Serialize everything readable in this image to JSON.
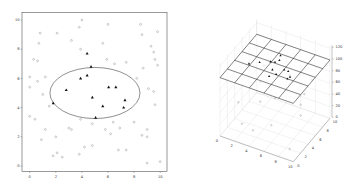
{
  "chart_data": [
    {
      "type": "scatter",
      "title": "",
      "xlabel": "",
      "ylabel": "",
      "xlim": [
        -0.5,
        10.5
      ],
      "ylim": [
        -0.4,
        10.4
      ],
      "grid": false,
      "x_ticks": [
        "0",
        "2",
        "4",
        "6",
        "8",
        "10"
      ],
      "y_ticks": [
        "0",
        "2",
        "4",
        "6",
        "8",
        "10"
      ],
      "series": [
        {
          "name": "background points",
          "marker": "circle",
          "color": "#9a9a9a",
          "points": [
            [
              4.0,
              10.0
            ],
            [
              3.8,
              9.5
            ],
            [
              6.0,
              9.7
            ],
            [
              8.5,
              9.7
            ],
            [
              0.8,
              9.1
            ],
            [
              2.1,
              9.1
            ],
            [
              9.8,
              9.2
            ],
            [
              0.7,
              8.4
            ],
            [
              3.2,
              8.6
            ],
            [
              5.6,
              8.4
            ],
            [
              8.6,
              9.0
            ],
            [
              9.3,
              8.2
            ],
            [
              3.9,
              8.0
            ],
            [
              9.5,
              7.8
            ],
            [
              0.3,
              7.3
            ],
            [
              0.6,
              7.2
            ],
            [
              5.9,
              7.3
            ],
            [
              7.4,
              7.1
            ],
            [
              6.5,
              7.0
            ],
            [
              9.6,
              7.3
            ],
            [
              9.8,
              6.9
            ],
            [
              8.7,
              6.7
            ],
            [
              0.0,
              6.1
            ],
            [
              1.2,
              6.1
            ],
            [
              8.2,
              6.0
            ],
            [
              0.6,
              5.8
            ],
            [
              0.0,
              5.4
            ],
            [
              9.1,
              5.3
            ],
            [
              1.0,
              4.9
            ],
            [
              9.5,
              5.1
            ],
            [
              1.5,
              4.1
            ],
            [
              9.6,
              4.2
            ],
            [
              3.9,
              3.2
            ],
            [
              4.8,
              2.9
            ],
            [
              6.4,
              3.0
            ],
            [
              6.9,
              2.6
            ],
            [
              0.0,
              3.4
            ],
            [
              0.4,
              3.2
            ],
            [
              5.8,
              2.5
            ],
            [
              8.0,
              3.0
            ],
            [
              3.0,
              2.6
            ],
            [
              3.2,
              2.5
            ],
            [
              1.2,
              2.5
            ],
            [
              9.0,
              2.5
            ],
            [
              8.6,
              2.1
            ],
            [
              9.0,
              2.0
            ],
            [
              2.0,
              2.0
            ],
            [
              6.2,
              2.2
            ],
            [
              0.9,
              1.8
            ],
            [
              4.2,
              1.3
            ],
            [
              4.8,
              1.4
            ],
            [
              6.8,
              1.1
            ],
            [
              7.4,
              1.1
            ],
            [
              2.1,
              0.9
            ],
            [
              1.8,
              0.7
            ],
            [
              3.8,
              0.8
            ],
            [
              2.5,
              0.6
            ],
            [
              9.0,
              0.2
            ],
            [
              10.0,
              0.3
            ]
          ]
        },
        {
          "name": "points inside ellipse",
          "marker": "triangle",
          "color": "#111111",
          "points": [
            [
              4.4,
              7.7
            ],
            [
              4.7,
              6.8
            ],
            [
              3.9,
              6.0
            ],
            [
              4.4,
              6.2
            ],
            [
              2.8,
              5.2
            ],
            [
              6.05,
              5.4
            ],
            [
              6.6,
              5.4
            ],
            [
              4.8,
              4.7
            ],
            [
              1.8,
              4.3
            ],
            [
              5.6,
              4.1
            ],
            [
              7.3,
              4.5
            ],
            [
              7.2,
              4.0
            ],
            [
              5.05,
              3.3
            ]
          ]
        }
      ],
      "annotations": [
        {
          "type": "ellipse",
          "center": [
            5.0,
            5.0
          ],
          "rx": 3.45,
          "ry": 1.75,
          "color": "#444444"
        }
      ]
    },
    {
      "type": "scatter3d",
      "title": "",
      "xlabel": "",
      "ylabel": "",
      "zlabel": "",
      "xlim": [
        0,
        10
      ],
      "ylim": [
        0,
        10
      ],
      "zlim": [
        0,
        120
      ],
      "x_ticks": [
        "0",
        "2",
        "4",
        "6",
        "8",
        "10"
      ],
      "y_ticks": [
        "0",
        "2",
        "4",
        "6",
        "8",
        "10"
      ],
      "z_ticks": [
        "0",
        "20",
        "40",
        "60",
        "80",
        "100",
        "120"
      ],
      "grid": true,
      "surface": {
        "type": "plane",
        "z": 100,
        "grid_cells": [
          5,
          5
        ],
        "color": "#333333"
      },
      "series": [
        {
          "name": "points on plane",
          "marker": "triangle",
          "color": "#111111",
          "points": [
            [
              4.4,
              7.7,
              100
            ],
            [
              4.7,
              6.8,
              100
            ],
            [
              3.9,
              6.0,
              100
            ],
            [
              4.4,
              6.2,
              100
            ],
            [
              2.8,
              5.2,
              100
            ],
            [
              6.05,
              5.4,
              100
            ],
            [
              6.6,
              5.4,
              100
            ],
            [
              4.8,
              4.7,
              100
            ],
            [
              1.8,
              4.3,
              100
            ],
            [
              5.6,
              4.1,
              100
            ],
            [
              7.3,
              4.5,
              100
            ],
            [
              7.2,
              4.0,
              100
            ],
            [
              5.05,
              3.3,
              100
            ]
          ]
        },
        {
          "name": "background points",
          "marker": "circle",
          "color": "#9a9a9a",
          "points": [
            [
              2,
              8,
              70
            ],
            [
              5,
              9,
              60
            ],
            [
              8,
              7,
              55
            ],
            [
              1,
              3,
              40
            ],
            [
              3,
              5,
              35
            ],
            [
              6,
              2,
              30
            ],
            [
              9,
              4,
              45
            ],
            [
              4,
              1,
              20
            ],
            [
              7,
              8,
              25
            ],
            [
              2,
              2,
              15
            ],
            [
              8,
              9,
              65
            ],
            [
              5,
              5,
              50
            ],
            [
              9,
              1,
              10
            ],
            [
              1,
              9,
              30
            ]
          ]
        }
      ]
    }
  ],
  "left_plot": {
    "x_ticks": [
      "0",
      "2",
      "4",
      "6",
      "8",
      "10"
    ],
    "y_ticks": [
      "0",
      "2",
      "4",
      "6",
      "8",
      "10"
    ]
  },
  "right_plot": {
    "x_ticks": [
      "0",
      "2",
      "4",
      "6",
      "8",
      "10"
    ],
    "y_ticks": [
      "0",
      "2",
      "4",
      "6",
      "8",
      "10"
    ],
    "z_ticks": [
      "0",
      "20",
      "40",
      "60",
      "80",
      "100",
      "120"
    ]
  }
}
